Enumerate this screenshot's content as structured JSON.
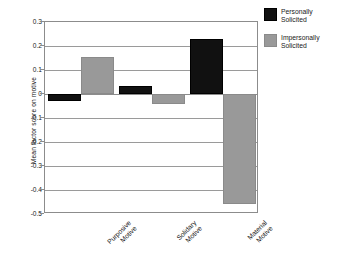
{
  "chart_data": {
    "type": "bar",
    "title": "",
    "subtitle": "",
    "xlabel": "",
    "ylabel": "Mean factor score on motive",
    "categories": [
      "Purposive\nMotive",
      "Solidary\nMotive",
      "Material\nMotive"
    ],
    "category_lines": [
      [
        "Purposive",
        "Motive"
      ],
      [
        "Solidary",
        "Motive"
      ],
      [
        "Material",
        "Motive"
      ]
    ],
    "series": [
      {
        "name": "Personally Solicited",
        "name_lines": [
          "Personally",
          "Solicited"
        ],
        "color": "#111111",
        "values": [
          -0.03,
          0.035,
          0.23
        ]
      },
      {
        "name": "Impersonally Solicited",
        "name_lines": [
          "Impersonally",
          "Solicited"
        ],
        "color": "#999999",
        "values": [
          0.155,
          -0.04,
          -0.46
        ]
      }
    ],
    "ylim": [
      -0.5,
      0.3
    ],
    "yticks": [
      0.3,
      0.2,
      0.1,
      0,
      -0.1,
      -0.2,
      -0.3,
      -0.4,
      -0.5
    ],
    "ytick_labels": [
      "0.3",
      "0.2",
      "0.1",
      "0",
      "-0.1",
      "-0.2",
      "-0.3",
      "-0.4",
      "-0.5"
    ],
    "grid": true,
    "grid_axis": "y",
    "legend_position": "right-top",
    "orientation": "vertical",
    "bar_grouping": "grouped"
  },
  "axis": {
    "y_title": "Mean factor score on motive"
  },
  "legend": {
    "entries": [
      {
        "line1": "Personally",
        "line2": "Solicited",
        "color": "#111111"
      },
      {
        "line1": "Impersonally",
        "line2": "Solicited",
        "color": "#999999"
      }
    ]
  },
  "categories": [
    {
      "line1": "Purposive",
      "line2": "Motive"
    },
    {
      "line1": "Solidary",
      "line2": "Motive"
    },
    {
      "line1": "Material",
      "line2": "Motive"
    }
  ],
  "yticks": [
    {
      "label": "0.3"
    },
    {
      "label": "0.2"
    },
    {
      "label": "0.1"
    },
    {
      "label": "0"
    },
    {
      "label": "-0.1"
    },
    {
      "label": "-0.2"
    },
    {
      "label": "-0.3"
    },
    {
      "label": "-0.4"
    },
    {
      "label": "-0.5"
    }
  ],
  "colors": {
    "personally": "#111111",
    "impersonally": "#999999",
    "grid": "#9a9a9a",
    "frame": "#8c8c8c",
    "background": "#ffffff"
  }
}
